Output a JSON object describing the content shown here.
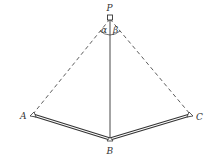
{
  "diagram": {
    "type": "geometry-figure",
    "points": {
      "P": {
        "label": "P",
        "x": 110,
        "y": 17
      },
      "A": {
        "label": "A",
        "x": 32,
        "y": 116
      },
      "B": {
        "label": "B",
        "x": 110,
        "y": 140
      },
      "C": {
        "label": "C",
        "x": 191,
        "y": 116
      }
    },
    "angles": {
      "alpha": {
        "label": "α"
      },
      "beta": {
        "label": "β"
      }
    },
    "edges": [
      {
        "from": "P",
        "to": "A",
        "style": "dashed"
      },
      {
        "from": "P",
        "to": "C",
        "style": "dashed"
      },
      {
        "from": "P",
        "to": "B",
        "style": "solid"
      },
      {
        "from": "A",
        "to": "B",
        "style": "double"
      },
      {
        "from": "B",
        "to": "C",
        "style": "double"
      }
    ],
    "colors": {
      "line": "#333333",
      "background": "#ffffff"
    }
  }
}
